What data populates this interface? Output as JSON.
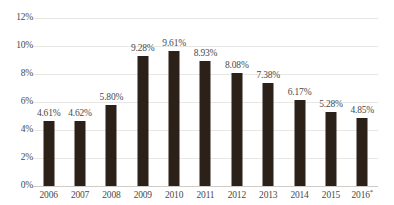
{
  "chart_data": {
    "type": "bar",
    "title": "",
    "subtitle": "",
    "xlabel": "",
    "ylabel": "",
    "categories": [
      "2006",
      "2007",
      "2008",
      "2009",
      "2010",
      "2011",
      "2012",
      "2013",
      "2014",
      "2015",
      "2016"
    ],
    "category_suffixes": [
      "",
      "",
      "",
      "",
      "",
      "",
      "",
      "",
      "",
      "",
      "*"
    ],
    "values": [
      4.61,
      4.62,
      5.8,
      9.28,
      9.61,
      8.93,
      8.08,
      7.38,
      6.17,
      5.28,
      4.85
    ],
    "value_labels": [
      "4.61%",
      "4.62%",
      "5.80%",
      "9.28%",
      "9.61%",
      "8.93%",
      "8.08%",
      "7.38%",
      "6.17%",
      "5.28%",
      "4.85%"
    ],
    "ylim": [
      0,
      12
    ],
    "yticks": [
      0,
      2,
      4,
      6,
      8,
      10,
      12
    ],
    "ytick_labels": [
      "0%",
      "2%",
      "4%",
      "6%",
      "8%",
      "10%",
      "12%"
    ],
    "grid": true,
    "legend": "none",
    "bar_color": "#2b2118",
    "gridline_color": "#e9e7e4",
    "axis_color": "#cfccc8",
    "text_color": "#4a4a4a",
    "background_color": "#ffffff"
  }
}
